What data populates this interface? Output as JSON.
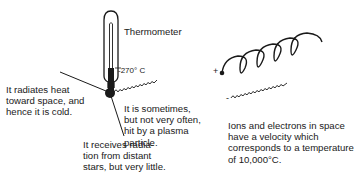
{
  "diagram": {
    "thermometer": {
      "label": "Thermometer",
      "reading": "-270° C"
    },
    "annotations": {
      "radiates": "It radiates heat\ntoward space, and\nhence it is cold.",
      "plasma_hit": "It is sometimes,\nbut not very often,\nhit by a plasma\nparticle.",
      "receives": "It receives radia-\ntion from distant\nstars, but very little.",
      "ions": "Ions and electrons in space\nhave a velocity which\ncorresponds to a temperature\nof 10,000°C."
    },
    "symbols": {
      "particle_marker": "+",
      "small_particle_marker": "-"
    },
    "colors": {
      "ink": "#1a1a1a",
      "background": "#ffffff"
    }
  }
}
